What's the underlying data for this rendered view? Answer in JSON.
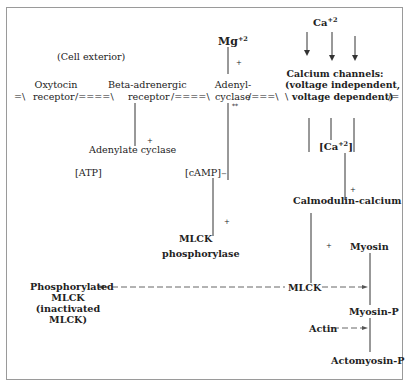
{
  "diagram": {
    "cell_exterior": "(Cell exterior)",
    "membrane": {
      "oxytocin_receptor": [
        "Oxytocin",
        "receptor"
      ],
      "beta_receptor": [
        "Beta-adrenergic",
        "receptor"
      ],
      "adenyl_cyclase": [
        "Adenyl-",
        "cyclase"
      ],
      "calcium_channels": [
        "Calcium channels:",
        "(voltage independent,",
        "voltage dependent)"
      ]
    },
    "mg": "Mg",
    "mg_charge": "+2",
    "ca_top": "Ca",
    "ca_top_charge": "+2",
    "ca_internal": "[Ca",
    "ca_internal_charge": "+2",
    "ca_internal_close": "]",
    "adenylate_cyclase": "Adenylate cyclase",
    "atp": "[ATP]",
    "camp": "[cAMP]",
    "mlck_phosphorylase": [
      "MLCK",
      "phosphorylase"
    ],
    "calmodulin_calcium": "Calmodulin-calcium",
    "mlck": "MLCK",
    "phosphorylated_mlck": [
      "Phosphorylated",
      "MLCK",
      "(inactivated",
      "MLCK)"
    ],
    "myosin": "Myosin",
    "myosin_p": "Myosin-P",
    "actin": "Actin",
    "actomyosin_p": "Actomyosin-P",
    "signs": {
      "plus": "+",
      "minus": "−",
      "star": "*",
      "double_star": "**"
    },
    "membrane_segments": {
      "left": "=\\",
      "mid1": "/====\\",
      "mid2": "/====\\",
      "mid3": "/===\\",
      "right": "/="
    }
  }
}
